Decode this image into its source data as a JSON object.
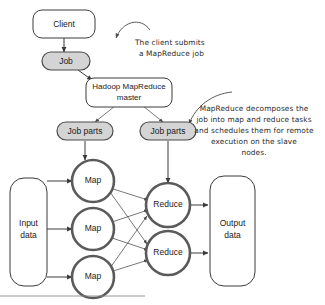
{
  "diagram": {
    "nodes": {
      "client": {
        "label": "Client"
      },
      "job": {
        "label": "Job"
      },
      "master": {
        "label_line1": "Hadoop MapReduce",
        "label_line2": "master"
      },
      "job_parts_left": {
        "label": "Job parts"
      },
      "job_parts_right": {
        "label": "Job parts"
      },
      "input_data": {
        "label_line1": "Input",
        "label_line2": "data"
      },
      "output_data": {
        "label_line1": "Output",
        "label_line2": "data"
      },
      "map_nodes": [
        {
          "label": "Map"
        },
        {
          "label": "Map"
        },
        {
          "label": "Map"
        }
      ],
      "reduce_nodes": [
        {
          "label": "Reduce"
        },
        {
          "label": "Reduce"
        }
      ]
    },
    "annotations": {
      "client_note": {
        "lines": [
          "The client submits",
          "a MapReduce job"
        ]
      },
      "master_note": {
        "lines": [
          "MapReduce decomposes the",
          "job into map and reduce tasks",
          "and schedules them for remote",
          "execution on the slave",
          "nodes."
        ]
      }
    },
    "colors": {
      "pill_fill": "#d4d4d4",
      "pill_stroke": "#4a4a4a",
      "box_stroke": "#3a3a3a",
      "ring_stroke": "#5a5a5a",
      "text": "#1a1a1a",
      "note_text": "#2b2b2b",
      "background": "#ffffff"
    }
  }
}
